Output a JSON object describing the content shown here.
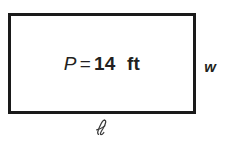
{
  "figure": {
    "type": "rectangle-diagram",
    "shape_name": "rectangle",
    "background_color": "#ffffff",
    "stroke_color": "#1a1a1a",
    "stroke_width_px": 3,
    "text_color": "#231f20",
    "interior_label": {
      "full_text": "P = 14 ft",
      "variable": "P",
      "equals": "=",
      "value": "14",
      "unit": "ft"
    },
    "width_label": {
      "symbol": "w",
      "meaning": "width"
    },
    "length_label": {
      "symbol": "ℓ",
      "meaning": "length"
    }
  }
}
